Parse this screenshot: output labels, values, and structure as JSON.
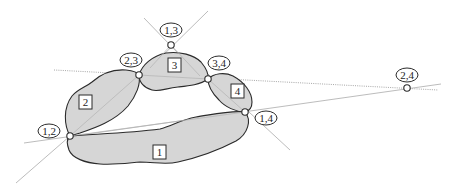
{
  "diagram": {
    "title": "",
    "regions": [
      {
        "id": "region-1",
        "label": "1"
      },
      {
        "id": "region-2",
        "label": "2"
      },
      {
        "id": "region-3",
        "label": "3"
      },
      {
        "id": "region-4",
        "label": "4"
      }
    ],
    "intersections": [
      {
        "id": "pt-1-3",
        "label": "1,3"
      },
      {
        "id": "pt-2-3",
        "label": "2,3"
      },
      {
        "id": "pt-3-4",
        "label": "3,4"
      },
      {
        "id": "pt-2-4",
        "label": "2,4"
      },
      {
        "id": "pt-1-2",
        "label": "1,2"
      },
      {
        "id": "pt-1-4",
        "label": "1,4"
      }
    ],
    "colors": {
      "fill": "#d6d6d6",
      "outline": "#2b2b2b",
      "guide_lines": "#b4b4b4"
    }
  }
}
